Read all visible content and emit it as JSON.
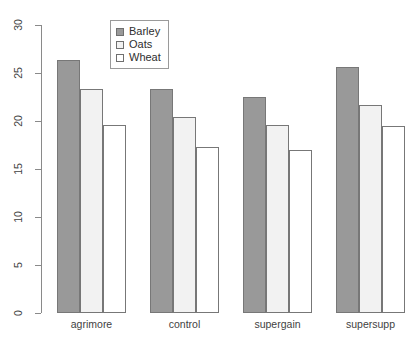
{
  "chart_data": {
    "type": "bar",
    "title": "",
    "xlabel": "",
    "ylabel": "",
    "ylim": [
      0,
      30
    ],
    "yticks": [
      0,
      5,
      10,
      15,
      20,
      25,
      30
    ],
    "grid": false,
    "legend_position": "top-center",
    "categories": [
      "agrimore",
      "control",
      "supergain",
      "supersupp"
    ],
    "series": [
      {
        "name": "Barley",
        "color": "#999999",
        "values": [
          26.4,
          23.3,
          22.5,
          25.6
        ]
      },
      {
        "name": "Oats",
        "color": "#f2f2f2",
        "values": [
          23.3,
          20.4,
          19.6,
          21.7
        ]
      },
      {
        "name": "Wheat",
        "color": "#ffffff",
        "values": [
          19.6,
          17.3,
          17.0,
          19.5
        ]
      }
    ]
  },
  "axis": {
    "tick_labels": [
      "0",
      "5",
      "10",
      "15",
      "20",
      "25",
      "30"
    ]
  },
  "legend": {
    "entries": [
      {
        "label": "Barley"
      },
      {
        "label": "Oats"
      },
      {
        "label": "Wheat"
      }
    ]
  }
}
